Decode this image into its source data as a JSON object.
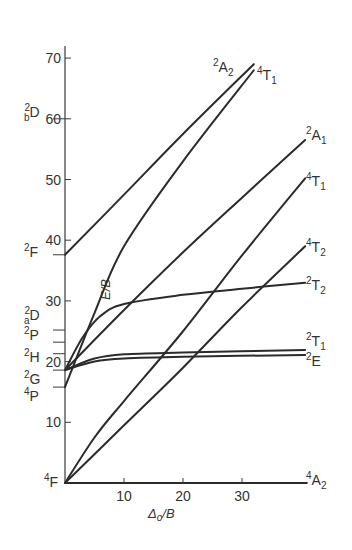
{
  "chart_data": {
    "type": "line",
    "title": "",
    "xlabel": "Δo/B",
    "ylabel": "E/B",
    "xlim": [
      0,
      41
    ],
    "ylim": [
      0,
      72
    ],
    "grid": false,
    "legend": "none (curves labelled at right end; free-ion terms labelled on left axis)",
    "x_ticks": [
      10,
      20,
      30
    ],
    "y_ticks": [
      10,
      20,
      30,
      40,
      50,
      60,
      70
    ],
    "free_ion_terms": [
      {
        "label": "4F",
        "energy": 0
      },
      {
        "label": "4P",
        "energy": 15.8
      },
      {
        "label": "2G",
        "energy": 18.6
      },
      {
        "label": "2H",
        "energy": 21.3
      },
      {
        "label": "2P",
        "energy": 23.2
      },
      {
        "label": "2aD",
        "energy": 25.2
      },
      {
        "label": "2F",
        "energy": 37.6
      },
      {
        "label": "2bD",
        "energy": 60
      }
    ],
    "series": [
      {
        "name": "4A2",
        "points": [
          [
            0,
            0
          ],
          [
            41,
            0
          ]
        ]
      },
      {
        "name": "4T2",
        "points": [
          [
            0,
            0
          ],
          [
            10,
            9.5
          ],
          [
            20,
            19
          ],
          [
            30,
            29
          ],
          [
            40.7,
            39
          ]
        ]
      },
      {
        "name": "4T1 (F)",
        "points": [
          [
            0,
            0
          ],
          [
            5,
            7.5
          ],
          [
            10,
            13.5
          ],
          [
            20,
            25
          ],
          [
            30,
            37.5
          ],
          [
            40.7,
            50.2
          ]
        ]
      },
      {
        "name": "4T1 (P)",
        "points": [
          [
            0,
            15.8
          ],
          [
            5,
            28
          ],
          [
            10,
            39
          ],
          [
            20,
            53
          ],
          [
            32,
            68
          ]
        ]
      },
      {
        "name": "2E",
        "points": [
          [
            0,
            18.6
          ],
          [
            5,
            20
          ],
          [
            10,
            20.5
          ],
          [
            20,
            20.8
          ],
          [
            40.7,
            21.1
          ]
        ]
      },
      {
        "name": "2T1",
        "points": [
          [
            0,
            18.6
          ],
          [
            5,
            20.5
          ],
          [
            10,
            21.2
          ],
          [
            20,
            21.5
          ],
          [
            40.7,
            21.9
          ]
        ]
      },
      {
        "name": "2T2",
        "points": [
          [
            0,
            18.6
          ],
          [
            3,
            24
          ],
          [
            6,
            27.5
          ],
          [
            10,
            29.5
          ],
          [
            20,
            31
          ],
          [
            30,
            32
          ],
          [
            40.7,
            33
          ]
        ]
      },
      {
        "name": "2A1",
        "points": [
          [
            0,
            18.6
          ],
          [
            10,
            28.5
          ],
          [
            20,
            38
          ],
          [
            30,
            47
          ],
          [
            40.7,
            56.5
          ]
        ]
      },
      {
        "name": "2A2",
        "points": [
          [
            0,
            37.6
          ],
          [
            10,
            47.5
          ],
          [
            20,
            57.5
          ],
          [
            32,
            69
          ]
        ]
      }
    ]
  },
  "labels": {
    "xlabel": "Δo/B",
    "ylabel": "E/B",
    "right_terms": [
      "2A2",
      "4T1",
      "2A1",
      "4T1",
      "4T2",
      "2T2",
      "2T1",
      "2E",
      "4A2"
    ]
  }
}
